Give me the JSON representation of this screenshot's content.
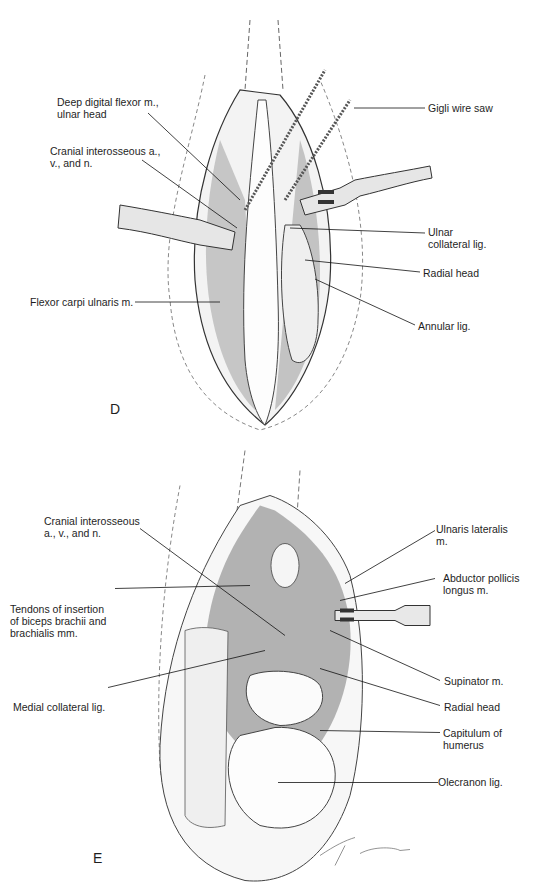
{
  "panel_d": {
    "letter": "D",
    "labels": [
      {
        "id": "deep-digital-flexor",
        "lines": [
          "Deep digital flexor m.,",
          "ulnar head"
        ]
      },
      {
        "id": "cranial-interosseous",
        "lines": [
          "Cranial interosseous a.,",
          "v., and n."
        ]
      },
      {
        "id": "flexor-carpi-ulnaris",
        "lines": [
          "Flexor carpi ulnaris m."
        ]
      },
      {
        "id": "gigli-wire-saw",
        "lines": [
          "Gigli wire saw"
        ]
      },
      {
        "id": "ulnar-collateral-lig",
        "lines": [
          "Ulnar",
          "collateral lig."
        ]
      },
      {
        "id": "radial-head",
        "lines": [
          "Radial head"
        ]
      },
      {
        "id": "annular-lig",
        "lines": [
          "Annular lig."
        ]
      }
    ]
  },
  "panel_e": {
    "letter": "E",
    "labels": [
      {
        "id": "cranial-interosseous",
        "lines": [
          "Cranial interosseous",
          "a., v., and n."
        ]
      },
      {
        "id": "tendons-of-insertion",
        "lines": [
          "Tendons of insertion",
          "of biceps brachii and",
          "brachialis mm."
        ]
      },
      {
        "id": "medial-collateral-lig",
        "lines": [
          "Medial collateral lig."
        ]
      },
      {
        "id": "ulnaris-lateralis",
        "lines": [
          "Ulnaris lateralis",
          "m."
        ]
      },
      {
        "id": "abductor-pollicis-longus",
        "lines": [
          "Abductor pollicis",
          "longus m."
        ]
      },
      {
        "id": "supinator",
        "lines": [
          "Supinator m."
        ]
      },
      {
        "id": "radial-head",
        "lines": [
          "Radial head"
        ]
      },
      {
        "id": "capitulum-of-humerus",
        "lines": [
          "Capitulum of",
          "humerus"
        ]
      },
      {
        "id": "olecranon-lig",
        "lines": [
          "Olecranon lig."
        ]
      }
    ],
    "signature": "Giddings"
  }
}
